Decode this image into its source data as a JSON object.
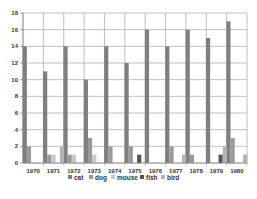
{
  "chart_data": {
    "type": "bar",
    "title": "",
    "xlabel": "",
    "ylabel": "",
    "ylim": [
      0,
      18
    ],
    "yticks": [
      0,
      2,
      4,
      6,
      8,
      10,
      12,
      14,
      16,
      18
    ],
    "grid": true,
    "legend_position": "bottom",
    "categories": [
      "1970",
      "1971",
      "1972",
      "1973",
      "1974",
      "1975",
      "1976",
      "1977",
      "1978",
      "1979",
      "1980"
    ],
    "series": [
      {
        "name": "cat",
        "color": "#7f7f7f",
        "values": [
          14,
          11,
          14,
          10,
          14,
          12,
          16,
          14,
          16,
          15,
          17
        ]
      },
      {
        "name": "dog",
        "color": "#9a9a9a",
        "values": [
          2,
          1,
          1,
          3,
          2,
          2,
          0,
          2,
          1,
          0,
          3
        ]
      },
      {
        "name": "mouse",
        "color": "#c8c8c8",
        "values": [
          0,
          1,
          1,
          1,
          0,
          0,
          0,
          0,
          0,
          0,
          0
        ]
      },
      {
        "name": "fish",
        "color": "#555555",
        "values": [
          0,
          0,
          0,
          0,
          0,
          1,
          0,
          0,
          0,
          1,
          0
        ]
      },
      {
        "name": "bird",
        "color": "#b4b4b4",
        "values": [
          0,
          2,
          0,
          0,
          0,
          0,
          0,
          1,
          0,
          2,
          1
        ]
      }
    ]
  },
  "legend": {
    "items": [
      {
        "label": "cat"
      },
      {
        "label": "dog"
      },
      {
        "label": "mouse"
      },
      {
        "label": "fish"
      },
      {
        "label": "bird"
      }
    ]
  }
}
